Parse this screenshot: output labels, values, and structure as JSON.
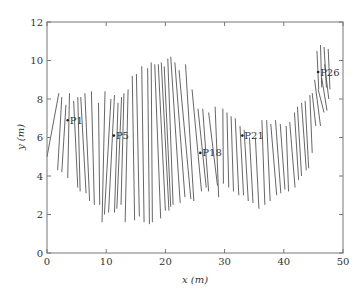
{
  "chart_data": {
    "type": "line",
    "title": "",
    "xlabel": "x (m)",
    "ylabel": "y (m)",
    "xlim": [
      0,
      50
    ],
    "ylim": [
      0,
      12
    ],
    "xticks": [
      0,
      10,
      20,
      30,
      40,
      50
    ],
    "yticks": [
      0,
      2,
      4,
      6,
      8,
      10,
      12
    ],
    "grid": false,
    "legend": null,
    "segments": [
      [
        2.0,
        8.3,
        0.0,
        5.0
      ],
      [
        2.5,
        8.1,
        1.8,
        4.3
      ],
      [
        3.2,
        7.7,
        2.5,
        4.2
      ],
      [
        3.8,
        8.3,
        3.5,
        3.9
      ],
      [
        4.5,
        7.9,
        5.2,
        3.4
      ],
      [
        5.2,
        8.1,
        5.6,
        3.2
      ],
      [
        5.7,
        8.1,
        6.6,
        3.1
      ],
      [
        6.4,
        8.3,
        7.2,
        2.7
      ],
      [
        7.5,
        8.4,
        8.0,
        2.5
      ],
      [
        8.7,
        7.8,
        8.9,
        2.5
      ],
      [
        9.8,
        8.4,
        9.3,
        1.6
      ],
      [
        10.8,
        8.0,
        9.7,
        2.0
      ],
      [
        11.4,
        8.2,
        10.4,
        2.1
      ],
      [
        12.0,
        7.8,
        11.4,
        2.1
      ],
      [
        12.6,
        8.1,
        11.8,
        2.3
      ],
      [
        13.0,
        8.3,
        12.5,
        2.5
      ],
      [
        13.7,
        8.5,
        13.2,
        1.6
      ],
      [
        14.4,
        9.2,
        14.8,
        1.7
      ],
      [
        15.1,
        9.3,
        15.6,
        1.9
      ],
      [
        16.0,
        9.7,
        16.4,
        1.6
      ],
      [
        17.0,
        9.6,
        17.3,
        1.5
      ],
      [
        17.6,
        9.9,
        17.8,
        1.6
      ],
      [
        18.2,
        9.8,
        19.2,
        1.8
      ],
      [
        18.8,
        9.8,
        20.0,
        2.2
      ],
      [
        19.3,
        9.9,
        20.6,
        2.2
      ],
      [
        19.8,
        9.7,
        20.9,
        2.4
      ],
      [
        20.4,
        10.1,
        21.3,
        2.5
      ],
      [
        20.9,
        10.2,
        22.5,
        2.6
      ],
      [
        21.6,
        9.9,
        23.3,
        2.9
      ],
      [
        22.3,
        9.5,
        24.3,
        2.8
      ],
      [
        23.4,
        9.8,
        24.8,
        2.7
      ],
      [
        24.5,
        8.5,
        26.1,
        3.2
      ],
      [
        25.5,
        7.5,
        26.9,
        3.4
      ],
      [
        26.3,
        7.5,
        27.3,
        3.2
      ],
      [
        27.3,
        7.3,
        28.8,
        3.5
      ],
      [
        28.4,
        7.6,
        29.0,
        2.9
      ],
      [
        29.7,
        7.5,
        29.8,
        3.6
      ],
      [
        30.4,
        7.3,
        30.7,
        3.4
      ],
      [
        31.1,
        7.1,
        31.5,
        3.2
      ],
      [
        31.8,
        7.0,
        32.4,
        3.0
      ],
      [
        32.6,
        6.6,
        33.2,
        3.0
      ],
      [
        33.3,
        6.4,
        34.0,
        2.7
      ],
      [
        34.2,
        6.0,
        34.8,
        2.6
      ],
      [
        35.2,
        6.0,
        35.8,
        2.3
      ],
      [
        36.3,
        6.9,
        36.8,
        2.5
      ],
      [
        37.1,
        6.9,
        37.7,
        2.7
      ],
      [
        37.8,
        6.7,
        38.8,
        3.0
      ],
      [
        38.6,
        6.9,
        39.5,
        3.1
      ],
      [
        39.4,
        6.7,
        40.2,
        3.3
      ],
      [
        40.4,
        6.6,
        40.8,
        3.2
      ],
      [
        41.0,
        6.8,
        41.9,
        3.4
      ],
      [
        41.8,
        7.3,
        42.5,
        3.8
      ],
      [
        42.3,
        7.6,
        43.0,
        4.0
      ],
      [
        43.0,
        7.8,
        43.8,
        4.3
      ],
      [
        43.6,
        7.9,
        44.2,
        4.4
      ],
      [
        44.4,
        8.2,
        44.8,
        5.2
      ],
      [
        44.8,
        8.3,
        45.4,
        6.6
      ],
      [
        45.2,
        9.0,
        46.2,
        6.6
      ],
      [
        45.8,
        8.5,
        46.8,
        7.3
      ],
      [
        46.4,
        9.1,
        47.3,
        7.4
      ],
      [
        46.9,
        9.8,
        47.6,
        8.0
      ],
      [
        45.6,
        10.5,
        45.9,
        8.5
      ],
      [
        46.2,
        10.8,
        46.4,
        8.6
      ],
      [
        46.8,
        10.7,
        47.2,
        8.6
      ],
      [
        47.5,
        10.6,
        47.8,
        8.5
      ]
    ],
    "points": [
      {
        "label": "P1",
        "x": 3.5,
        "y": 6.9
      },
      {
        "label": "P5",
        "x": 11.3,
        "y": 6.1
      },
      {
        "label": "P18",
        "x": 25.9,
        "y": 5.2
      },
      {
        "label": "P21",
        "x": 33.0,
        "y": 6.1
      },
      {
        "label": "P26",
        "x": 45.8,
        "y": 9.4
      }
    ]
  }
}
